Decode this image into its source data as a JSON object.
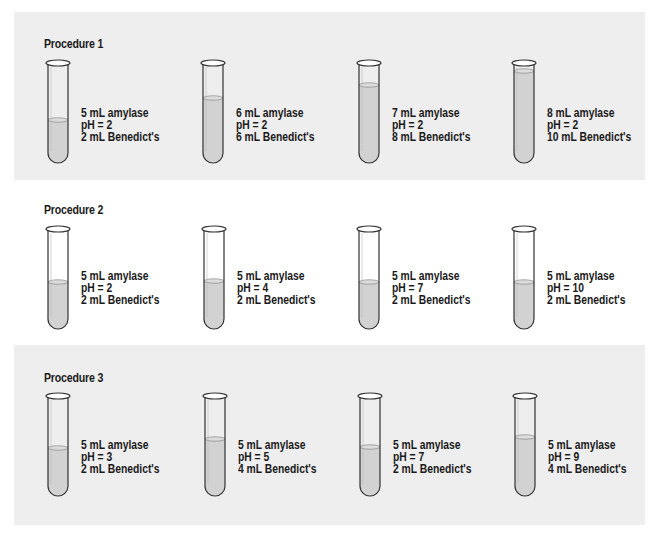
{
  "procedures": [
    {
      "title": "Procedure 1",
      "background": "#eeeeee",
      "tubes": [
        {
          "amylase": "5 mL amylase",
          "ph": "pH = 2",
          "benedicts": "2 mL Benedict's",
          "fill_top": 61
        },
        {
          "amylase": "6 mL amylase",
          "ph": "pH = 2",
          "benedicts": "6 mL Benedict's",
          "fill_top": 39
        },
        {
          "amylase": "7 mL amylase",
          "ph": "pH = 2",
          "benedicts": "8 mL Benedict's",
          "fill_top": 26
        },
        {
          "amylase": "8 mL amylase",
          "ph": "pH = 2",
          "benedicts": "10 mL Benedict's",
          "fill_top": 12
        }
      ]
    },
    {
      "title": "Procedure 2",
      "background": "#ffffff",
      "tubes": [
        {
          "amylase": "5 mL amylase",
          "ph": "pH = 2",
          "benedicts": "2 mL Benedict's",
          "fill_top": 57
        },
        {
          "amylase": "5 mL amylase",
          "ph": "pH = 4",
          "benedicts": "2 mL Benedict's",
          "fill_top": 56
        },
        {
          "amylase": "5 mL amylase",
          "ph": "pH = 7",
          "benedicts": "2 mL Benedict's",
          "fill_top": 57
        },
        {
          "amylase": "5 mL amylase",
          "ph": "pH = 10",
          "benedicts": "2 mL Benedict's",
          "fill_top": 57
        }
      ]
    },
    {
      "title": "Procedure 3",
      "background": "#eeeeee",
      "tubes": [
        {
          "amylase": "5 mL amylase",
          "ph": "pH = 3",
          "benedicts": "2 mL Benedict's",
          "fill_top": 56
        },
        {
          "amylase": "5 mL amylase",
          "ph": "pH = 5",
          "benedicts": "4 mL Benedict's",
          "fill_top": 47
        },
        {
          "amylase": "5 mL amylase",
          "ph": "pH = 7",
          "benedicts": "2 mL Benedict's",
          "fill_top": 55
        },
        {
          "amylase": "5 mL amylase",
          "ph": "pH = 9",
          "benedicts": "4 mL Benedict's",
          "fill_top": 45
        }
      ]
    }
  ],
  "colors": {
    "panel_shaded": "#eeeeee",
    "liquid": "#d2d2d2",
    "glass_outline": "#333333",
    "text": "#1a1a1a"
  }
}
